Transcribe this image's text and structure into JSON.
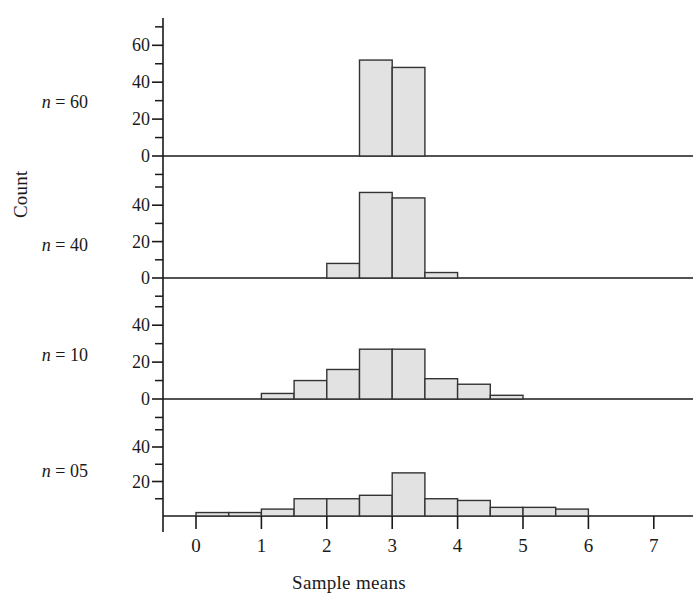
{
  "figure": {
    "ylabel": "Count",
    "xlabel": "Sample means",
    "x_ticks": [
      "0",
      "1",
      "2",
      "3",
      "4",
      "5",
      "6",
      "7"
    ],
    "bar_fill": "#e2e2e2",
    "bar_stroke": "#333333",
    "axis_color": "#1a1a1a"
  },
  "panels": [
    {
      "label_n": "n",
      "label_eq": "=",
      "label_val": "60",
      "y_ticks": [
        "0",
        "20",
        "40",
        "60"
      ],
      "bars": [
        {
          "x0": 2.5,
          "x1": 3.0,
          "count": 52
        },
        {
          "x0": 3.0,
          "x1": 3.5,
          "count": 48
        }
      ]
    },
    {
      "label_n": "n",
      "label_eq": "=",
      "label_val": "40",
      "y_ticks": [
        "0",
        "20",
        "40"
      ],
      "bars": [
        {
          "x0": 2.0,
          "x1": 2.5,
          "count": 8
        },
        {
          "x0": 2.5,
          "x1": 3.0,
          "count": 47
        },
        {
          "x0": 3.0,
          "x1": 3.5,
          "count": 44
        },
        {
          "x0": 3.5,
          "x1": 4.0,
          "count": 3
        }
      ]
    },
    {
      "label_n": "n",
      "label_eq": "=",
      "label_val": "10",
      "y_ticks": [
        "0",
        "20",
        "40"
      ],
      "bars": [
        {
          "x0": 1.0,
          "x1": 1.5,
          "count": 3
        },
        {
          "x0": 1.5,
          "x1": 2.0,
          "count": 10
        },
        {
          "x0": 2.0,
          "x1": 2.5,
          "count": 16
        },
        {
          "x0": 2.5,
          "x1": 3.0,
          "count": 27
        },
        {
          "x0": 3.0,
          "x1": 3.5,
          "count": 27
        },
        {
          "x0": 3.5,
          "x1": 4.0,
          "count": 11
        },
        {
          "x0": 4.0,
          "x1": 4.5,
          "count": 8
        },
        {
          "x0": 4.5,
          "x1": 5.0,
          "count": 2
        }
      ]
    },
    {
      "label_n": "n",
      "label_eq": "=",
      "label_val": "05",
      "y_ticks": [
        "20",
        "40"
      ],
      "bars": [
        {
          "x0": 0.0,
          "x1": 0.5,
          "count": 2
        },
        {
          "x0": 0.5,
          "x1": 1.0,
          "count": 2
        },
        {
          "x0": 1.0,
          "x1": 1.5,
          "count": 4
        },
        {
          "x0": 1.5,
          "x1": 2.0,
          "count": 10
        },
        {
          "x0": 2.0,
          "x1": 2.5,
          "count": 10
        },
        {
          "x0": 2.5,
          "x1": 3.0,
          "count": 12
        },
        {
          "x0": 3.0,
          "x1": 3.5,
          "count": 25
        },
        {
          "x0": 3.5,
          "x1": 4.0,
          "count": 10
        },
        {
          "x0": 4.0,
          "x1": 4.5,
          "count": 9
        },
        {
          "x0": 4.5,
          "x1": 5.0,
          "count": 5
        },
        {
          "x0": 5.0,
          "x1": 5.5,
          "count": 5
        },
        {
          "x0": 5.5,
          "x1": 6.0,
          "count": 4
        }
      ]
    }
  ],
  "chart_data": {
    "type": "bar",
    "title": "",
    "subtitle": "",
    "xlabel": "Sample means",
    "ylabel": "Count",
    "xlim": [
      -0.4,
      7.6
    ],
    "x_tick_labels": [
      "0",
      "1",
      "2",
      "3",
      "4",
      "5",
      "6",
      "7"
    ],
    "x_tick_values": [
      0,
      1,
      2,
      3,
      4,
      5,
      6,
      7
    ],
    "bin_width": 0.5,
    "grid": false,
    "legend": "none",
    "panel_layout": "4 stacked histogram panels sharing one x axis",
    "panels": [
      {
        "name": "n = 60",
        "ylim": [
          0,
          70
        ],
        "y_tick_labels": [
          "0",
          "20",
          "40",
          "60"
        ],
        "y_tick_values": [
          0,
          20,
          40,
          60
        ],
        "bin_left_edges": [
          2.5,
          3.0
        ],
        "bin_right_edges": [
          3.0,
          3.5
        ],
        "values": [
          52,
          48
        ]
      },
      {
        "name": "n = 40",
        "ylim": [
          0,
          55
        ],
        "y_tick_labels": [
          "0",
          "20",
          "40"
        ],
        "y_tick_values": [
          0,
          20,
          40
        ],
        "bin_left_edges": [
          2.0,
          2.5,
          3.0,
          3.5
        ],
        "bin_right_edges": [
          2.5,
          3.0,
          3.5,
          4.0
        ],
        "values": [
          8,
          47,
          44,
          3
        ]
      },
      {
        "name": "n = 10",
        "ylim": [
          0,
          50
        ],
        "y_tick_labels": [
          "0",
          "20",
          "40"
        ],
        "y_tick_values": [
          0,
          20,
          40
        ],
        "bin_left_edges": [
          1.0,
          1.5,
          2.0,
          2.5,
          3.0,
          3.5,
          4.0,
          4.5
        ],
        "bin_right_edges": [
          1.5,
          2.0,
          2.5,
          3.0,
          3.5,
          4.0,
          4.5,
          5.0
        ],
        "values": [
          3,
          10,
          16,
          27,
          27,
          11,
          8,
          2
        ]
      },
      {
        "name": "n = 05",
        "ylim": [
          0,
          50
        ],
        "y_tick_labels": [
          "20",
          "40"
        ],
        "y_tick_values": [
          20,
          40
        ],
        "bin_left_edges": [
          0.0,
          0.5,
          1.0,
          1.5,
          2.0,
          2.5,
          3.0,
          3.5,
          4.0,
          4.5,
          5.0,
          5.5
        ],
        "bin_right_edges": [
          0.5,
          1.0,
          1.5,
          2.0,
          2.5,
          3.0,
          3.5,
          4.0,
          4.5,
          5.0,
          5.5,
          6.0
        ],
        "values": [
          2,
          2,
          4,
          10,
          10,
          12,
          25,
          10,
          9,
          5,
          5,
          4
        ]
      }
    ]
  }
}
